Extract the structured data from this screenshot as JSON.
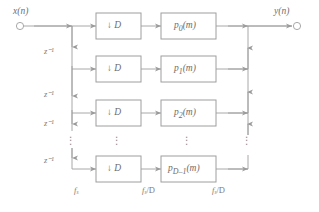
{
  "figure": {
    "kind": "block-diagram",
    "background_color": "#ffffff",
    "line_color": "#9a9a9a",
    "text_color": "#6f6f6f"
  },
  "ports": {
    "input": {
      "label_main": "x",
      "label_paren_open": "(",
      "label_arg": "n",
      "label_paren_close": ")",
      "full": "x(n)"
    },
    "output": {
      "label_main": "y",
      "label_paren_open": "(",
      "label_arg": "n",
      "label_paren_close": ")",
      "full": "y(n)"
    }
  },
  "delay_line": {
    "label_base": "z",
    "label_exp": "−1",
    "full": "z⁻¹",
    "count": 4,
    "labels": [
      "z⁻¹",
      "z⁻¹",
      "z⁻¹",
      "z⁻¹"
    ]
  },
  "rows": [
    {
      "index": 0,
      "decimator": {
        "arrow": "↓",
        "factor": "D",
        "full": "↓ D"
      },
      "filter": {
        "base": "p",
        "subscript": "0",
        "arg": "(m)",
        "full": "p₀(m)"
      }
    },
    {
      "index": 1,
      "decimator": {
        "arrow": "↓",
        "factor": "D",
        "full": "↓ D"
      },
      "filter": {
        "base": "p",
        "subscript": "1",
        "arg": "(m)",
        "full": "p₁(m)"
      }
    },
    {
      "index": 2,
      "decimator": {
        "arrow": "↓",
        "factor": "D",
        "full": "↓ D"
      },
      "filter": {
        "base": "p",
        "subscript": "2",
        "arg": "(m)",
        "full": "p₂(m)"
      }
    },
    {
      "index": 3,
      "decimator": {
        "arrow": "↓",
        "factor": "D",
        "full": "↓ D"
      },
      "filter": {
        "base": "p",
        "subscript": "D–1",
        "arg": "(m)",
        "full": "p_{D-1}(m)"
      }
    }
  ],
  "rate_labels": [
    {
      "id": "input-rate",
      "base": "f",
      "subscript": "s",
      "suffix": "",
      "full": "fₛ"
    },
    {
      "id": "mid-rate",
      "base": "f",
      "subscript": "s",
      "suffix": "/D",
      "full": "fₛ/D"
    },
    {
      "id": "output-rate",
      "base": "f",
      "subscript": "s",
      "suffix": "/D",
      "full": "fₛ/D"
    }
  ],
  "ellipsis": {
    "glyph": "⋮",
    "columns": [
      "delay-bus",
      "decimator-column",
      "filter-column",
      "sum-bus"
    ]
  }
}
